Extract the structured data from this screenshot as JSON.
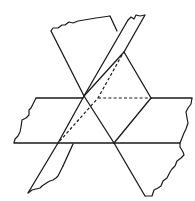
{
  "diagram": {
    "type": "three intersecting planes",
    "stroke_color": "#1a1a1a",
    "background": "#ffffff",
    "planes": [
      {
        "name": "horizontal-plane",
        "style": "solid edges with torn left and right ends"
      },
      {
        "name": "slanted-plane-x",
        "style": "solid edges with torn top and bottom ends"
      },
      {
        "name": "tilted-strip-plane",
        "style": "narrow strip with torn top and bottom ends"
      }
    ],
    "hidden_lines": [
      {
        "name": "dashed-horizontal-intersection"
      },
      {
        "name": "dashed-diagonal-intersection"
      }
    ]
  }
}
